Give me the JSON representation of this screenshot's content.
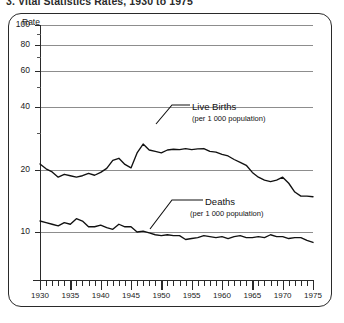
{
  "title": "3.  Vital Statistics Rates, 1930 to 1975",
  "axis": {
    "rate_label": "Rate",
    "y_ticks": [
      100,
      80,
      60,
      40,
      20,
      10
    ],
    "y_minor_ticks": [
      90,
      70,
      50,
      30
    ],
    "x_labels": [
      "1930",
      "1935",
      "1940",
      "1945",
      "1950",
      "1955",
      "1960",
      "1965",
      "1970",
      "1975"
    ]
  },
  "annotations": {
    "births_name": "Live Births",
    "births_sub": "(per 1 000 population)",
    "deaths_name": "Deaths",
    "deaths_sub": "(per 1 000 population)"
  },
  "chart_data": {
    "type": "line",
    "title": "3.  Vital Statistics Rates, 1930 to 1975",
    "xlabel": "",
    "ylabel": "Rate",
    "yscale": "log",
    "ylim": [
      7,
      100
    ],
    "xlim": [
      1930,
      1975
    ],
    "grid": true,
    "legend": "inline-annotations",
    "ytick_labels": [
      "10",
      "20",
      "40",
      "60",
      "80",
      "100"
    ],
    "x": [
      1930,
      1931,
      1932,
      1933,
      1934,
      1935,
      1936,
      1937,
      1938,
      1939,
      1940,
      1941,
      1942,
      1943,
      1944,
      1945,
      1946,
      1947,
      1948,
      1949,
      1950,
      1951,
      1952,
      1953,
      1954,
      1955,
      1956,
      1957,
      1958,
      1959,
      1960,
      1961,
      1962,
      1963,
      1964,
      1965,
      1966,
      1967,
      1968,
      1969,
      1970,
      1971,
      1972,
      1973,
      1974,
      1975
    ],
    "series": [
      {
        "name": "Live Births",
        "unit": "per 1 000 population",
        "values": [
          21.3,
          20.2,
          19.5,
          18.4,
          19.0,
          18.7,
          18.4,
          18.7,
          19.2,
          18.8,
          19.4,
          20.3,
          22.2,
          22.7,
          21.2,
          20.4,
          24.1,
          26.6,
          24.9,
          24.5,
          24.1,
          24.9,
          25.1,
          25.0,
          25.3,
          25.0,
          25.2,
          25.3,
          24.5,
          24.3,
          23.7,
          23.3,
          22.4,
          21.7,
          21.0,
          19.4,
          18.4,
          17.8,
          17.5,
          17.8,
          18.4,
          17.2,
          15.6,
          14.9,
          14.9,
          14.8
        ]
      },
      {
        "name": "Deaths",
        "unit": "per 1 000 population",
        "values": [
          11.3,
          11.1,
          10.9,
          10.7,
          11.1,
          10.9,
          11.6,
          11.3,
          10.6,
          10.6,
          10.8,
          10.5,
          10.3,
          10.9,
          10.6,
          10.6,
          10.0,
          10.1,
          9.9,
          9.7,
          9.6,
          9.7,
          9.6,
          9.6,
          9.2,
          9.3,
          9.4,
          9.6,
          9.5,
          9.4,
          9.5,
          9.3,
          9.5,
          9.6,
          9.4,
          9.4,
          9.5,
          9.4,
          9.7,
          9.5,
          9.5,
          9.3,
          9.4,
          9.4,
          9.1,
          8.9
        ]
      }
    ]
  }
}
